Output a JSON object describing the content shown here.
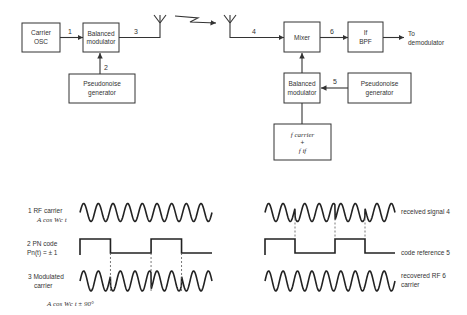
{
  "transmitter": {
    "carrier_osc": {
      "line1": "Carrier",
      "line2": "OSC"
    },
    "balanced_modulator": {
      "line1": "Balanced",
      "line2": "modulator"
    },
    "pn_generator": {
      "line1": "Pseudonoise",
      "line2": "generator"
    },
    "signal_labels": {
      "s1": "1",
      "s2": "2",
      "s3": "3"
    }
  },
  "receiver": {
    "mixer": {
      "label": "Mixer"
    },
    "if_bpf": {
      "line1": "If",
      "line2": "BPF"
    },
    "output": {
      "line1": "To",
      "line2": "demodulator"
    },
    "balanced_modulator": {
      "line1": "Balanced",
      "line2": "modulator"
    },
    "pn_generator": {
      "line1": "Pseudonoise",
      "line2": "generator"
    },
    "freq_source": {
      "line1": "f carrier",
      "line2": "+",
      "line3": "f if"
    },
    "signal_labels": {
      "s4": "4",
      "s5": "5",
      "s6": "6"
    }
  },
  "waveforms_left": {
    "rf_carrier": {
      "line1": "1  RF carrier",
      "line2": "A cos Wc t"
    },
    "pn_code": {
      "line1": "2 PN code",
      "line2": "Pn(t) = ± 1"
    },
    "modulated": {
      "line1": "3  Modulated",
      "line2": "carrier"
    },
    "formula": "A cos Wc t ± 90°"
  },
  "waveforms_right": {
    "received": "received signal 4",
    "code_ref": "code reference 5",
    "recovered": {
      "line1": "recovered RF  6",
      "line2": "carrier"
    }
  },
  "pn_sequence": [
    1,
    1,
    1,
    -1,
    -1,
    -1,
    -1,
    1,
    1,
    1,
    -1,
    -1,
    -1
  ],
  "carrier_cycles": 9
}
